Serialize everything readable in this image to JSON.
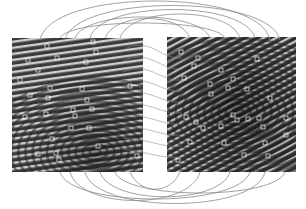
{
  "figure": {
    "background": "#ffffff",
    "arc_color": "#8a8a8a",
    "left_print": {
      "x": 12,
      "y": 38,
      "w": 131,
      "h": 134,
      "core": [
        95,
        152
      ]
    },
    "right_print": {
      "x": 167,
      "y": 37,
      "w": 129,
      "h": 135,
      "core": [
        238,
        112
      ]
    },
    "left_minutiae": [
      [
        47,
        46
      ],
      [
        93,
        42
      ],
      [
        96,
        52
      ],
      [
        28,
        60
      ],
      [
        57,
        58
      ],
      [
        86,
        62
      ],
      [
        38,
        70
      ],
      [
        20,
        80
      ],
      [
        130,
        86
      ],
      [
        50,
        88
      ],
      [
        82,
        89
      ],
      [
        30,
        95
      ],
      [
        48,
        98
      ],
      [
        87,
        100
      ],
      [
        25,
        117
      ],
      [
        46,
        114
      ],
      [
        73,
        110
      ],
      [
        92,
        109
      ],
      [
        75,
        116
      ],
      [
        71,
        128
      ],
      [
        89,
        128
      ],
      [
        52,
        139
      ],
      [
        38,
        154
      ],
      [
        56,
        153
      ],
      [
        59,
        160
      ],
      [
        98,
        146
      ],
      [
        137,
        156
      ]
    ],
    "right_minutiae": [
      [
        181,
        52
      ],
      [
        198,
        58
      ],
      [
        257,
        59
      ],
      [
        194,
        66
      ],
      [
        221,
        70
      ],
      [
        184,
        78
      ],
      [
        233,
        79
      ],
      [
        210,
        84
      ],
      [
        228,
        88
      ],
      [
        247,
        89
      ],
      [
        211,
        94
      ],
      [
        270,
        98
      ],
      [
        186,
        117
      ],
      [
        196,
        122
      ],
      [
        233,
        115
      ],
      [
        237,
        120
      ],
      [
        248,
        119
      ],
      [
        259,
        118
      ],
      [
        286,
        118
      ],
      [
        203,
        128
      ],
      [
        221,
        126
      ],
      [
        263,
        127
      ],
      [
        286,
        135
      ],
      [
        190,
        142
      ],
      [
        224,
        143
      ],
      [
        265,
        143
      ],
      [
        244,
        155
      ],
      [
        268,
        156
      ],
      [
        178,
        160
      ]
    ],
    "arcs_top": [
      [
        60,
        38,
        225,
        38,
        38
      ],
      [
        75,
        38,
        210,
        38,
        30
      ],
      [
        90,
        38,
        255,
        38,
        20
      ],
      [
        105,
        38,
        190,
        38,
        32
      ],
      [
        40,
        40,
        270,
        40,
        8
      ],
      [
        120,
        38,
        240,
        38,
        26
      ],
      [
        65,
        40,
        280,
        40,
        14
      ]
    ],
    "arcs_bottom": [
      [
        70,
        172,
        200,
        172,
        200
      ],
      [
        100,
        172,
        230,
        172,
        195
      ],
      [
        85,
        172,
        265,
        172,
        204
      ],
      [
        130,
        172,
        180,
        172,
        185
      ],
      [
        60,
        172,
        250,
        172,
        198
      ],
      [
        115,
        172,
        285,
        172,
        190
      ]
    ]
  }
}
